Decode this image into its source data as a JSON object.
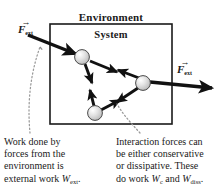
{
  "figure": {
    "kind": "physics-diagram",
    "top_cropped_text": "",
    "labels": {
      "environment": "Environment",
      "system": "System"
    },
    "vectors": [
      {
        "id": "f-ext-left",
        "symbol": "F",
        "arrow_accent": "→",
        "subscript": "ext",
        "position": "upper-left-outside-box",
        "direction": "down-right-into-system"
      },
      {
        "id": "f-ext-right",
        "symbol": "F",
        "arrow_accent": "→",
        "subscript": "ext",
        "position": "right-outside-box",
        "direction": "right-out-of-system"
      }
    ],
    "box": {
      "name": "system-boundary",
      "x": 50,
      "y": 24,
      "width": 122,
      "height": 100,
      "stroke": "#1a1a1a",
      "stroke_width": 1.5,
      "fill": "#ffffff"
    },
    "particles": [
      {
        "id": "particle-1",
        "cx": 82,
        "cy": 57,
        "r": 7.5
      },
      {
        "id": "particle-2",
        "cx": 143,
        "cy": 83,
        "r": 7.5
      },
      {
        "id": "particle-3",
        "cx": 95,
        "cy": 113,
        "r": 7.5
      }
    ],
    "interaction_arrows": [
      {
        "id": "arrow-p1-down",
        "from": "particle-1",
        "to": "free-space-below"
      },
      {
        "id": "arrow-p1-to-p2",
        "from": "particle-1",
        "to": "particle-2"
      },
      {
        "id": "arrow-p2-to-p1",
        "from": "particle-2",
        "to": "particle-1"
      },
      {
        "id": "arrow-p2-to-p3",
        "from": "particle-2",
        "to": "particle-3"
      },
      {
        "id": "arrow-p3-to-p2",
        "from": "particle-3",
        "to": "particle-2"
      },
      {
        "id": "arrow-p3-up",
        "from": "particle-3",
        "to": "free-space-above"
      }
    ],
    "colors": {
      "ink": "#1a1a1a",
      "particle_fill": "#d9d9d9",
      "particle_edge": "#333333",
      "leader": "#9a9a9a",
      "background": "#ffffff"
    }
  },
  "captions": {
    "left": {
      "name": "external-work-caption",
      "line1": "Work done by",
      "line2": "forces from the",
      "line3": "environment is",
      "line4_pre": "external work ",
      "line4_sym": "W",
      "line4_sub": "ext",
      "line4_post": "."
    },
    "right": {
      "name": "interaction-work-caption",
      "line1": "Interaction forces can",
      "line2": "be either conservative",
      "line3": "or dissipative. These",
      "line4_pre": "do work ",
      "line4_sym1": "W",
      "line4_sub1": "c",
      "line4_mid": " and ",
      "line4_sym2": "W",
      "line4_sub2": "diss",
      "line4_post": "."
    }
  },
  "leader_lines": [
    {
      "id": "leader-left",
      "from": "external-work-caption",
      "to": "f-ext-left-arrow-shaft",
      "style": "dotted"
    },
    {
      "id": "leader-right",
      "from": "interaction-work-caption",
      "to": "particle-3-interaction-arrow",
      "style": "dotted"
    }
  ]
}
